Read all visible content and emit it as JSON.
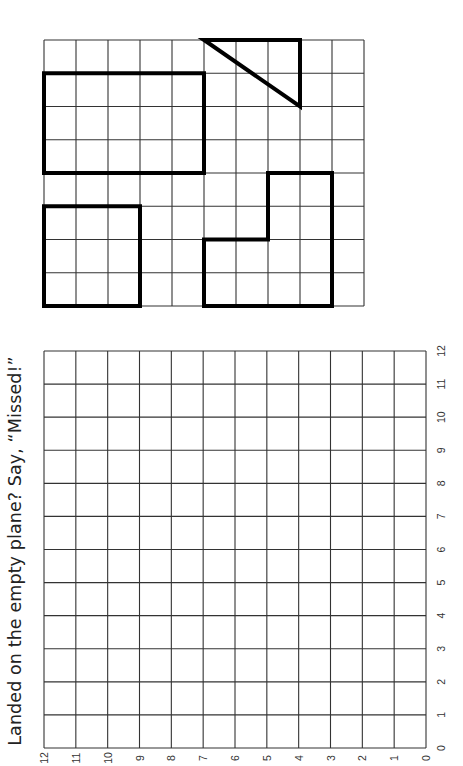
{
  "title": "Landed on the empty plane? Say, “Missed!”",
  "colors": {
    "grid_line": "#333333",
    "shape_line": "#000000",
    "background": "#ffffff"
  },
  "shapes_grid": {
    "columns": 10,
    "rows": 8,
    "shapes": [
      {
        "name": "triangle",
        "points": [
          [
            5,
            0
          ],
          [
            8,
            0
          ],
          [
            8,
            2
          ]
        ]
      },
      {
        "name": "large-rectangle",
        "points": [
          [
            0,
            1
          ],
          [
            5,
            1
          ],
          [
            5,
            4
          ],
          [
            0,
            4
          ]
        ]
      },
      {
        "name": "small-square",
        "points": [
          [
            0,
            5
          ],
          [
            3,
            5
          ],
          [
            3,
            8
          ],
          [
            0,
            8
          ]
        ]
      },
      {
        "name": "l-shape",
        "points": [
          [
            5,
            6
          ],
          [
            7,
            6
          ],
          [
            7,
            4
          ],
          [
            9,
            4
          ],
          [
            9,
            8
          ],
          [
            5,
            8
          ]
        ]
      }
    ]
  },
  "empty_grid": {
    "columns": 12,
    "rows": 12,
    "bottom_axis_labels": [
      "12",
      "11",
      "10",
      "9",
      "8",
      "7",
      "6",
      "5",
      "4",
      "3",
      "2",
      "1",
      "0"
    ],
    "right_axis_labels": [
      "12",
      "11",
      "10",
      "9",
      "8",
      "7",
      "6",
      "5",
      "4",
      "3",
      "2",
      "1",
      "0"
    ]
  }
}
